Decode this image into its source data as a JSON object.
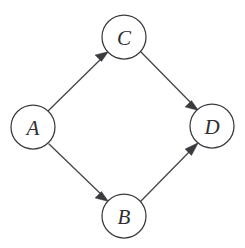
{
  "diagram": {
    "background_color": "#ffffff",
    "node_fill": "#ffffff",
    "node_stroke": "#3b3b3f",
    "edge_color": "#45454a",
    "label_color": "#2e2e33",
    "node_radius": 22,
    "nodes": [
      {
        "id": "A",
        "label": "A",
        "cx": 33,
        "cy": 127
      },
      {
        "id": "C",
        "label": "C",
        "cx": 124,
        "cy": 37
      },
      {
        "id": "D",
        "label": "D",
        "cx": 212,
        "cy": 126
      },
      {
        "id": "B",
        "label": "B",
        "cx": 124,
        "cy": 216
      }
    ],
    "edges": [
      {
        "id": "A-C",
        "from": "A",
        "to": "C",
        "directed": true,
        "arrowhead": "filled-triangle"
      },
      {
        "id": "C-D",
        "from": "C",
        "to": "D",
        "directed": true,
        "arrowhead": "filled-triangle"
      },
      {
        "id": "A-B",
        "from": "A",
        "to": "B",
        "directed": true,
        "arrowhead": "filled-triangle"
      },
      {
        "id": "B-D",
        "from": "B",
        "to": "D",
        "directed": true,
        "arrowhead": "filled-triangle"
      }
    ]
  }
}
